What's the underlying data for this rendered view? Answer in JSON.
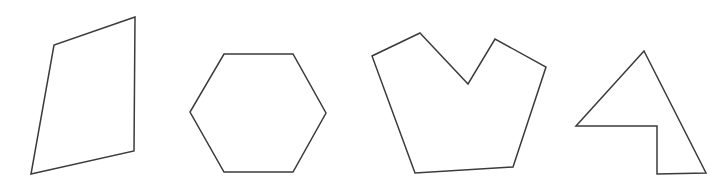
{
  "canvas": {
    "width": 721,
    "height": 185,
    "background_color": "#ffffff",
    "title": "Polygon Shapes"
  },
  "style": {
    "stroke_color": "#3b3b3b",
    "stroke_width": 1.5,
    "fill": "none"
  },
  "shapes": [
    {
      "name": "quadrilateral",
      "label": "Quadrilateral",
      "sides": 4,
      "convex": true,
      "points": "135,17 54,45 31,174 134,151",
      "vertices": [
        [
          135,
          17
        ],
        [
          54,
          45
        ],
        [
          31,
          174
        ],
        [
          134,
          151
        ]
      ]
    },
    {
      "name": "hexagon",
      "label": "Hexagon",
      "sides": 6,
      "convex": true,
      "points": "224,54 293,54 326,113 293,172 224,172 190,112",
      "vertices": [
        [
          224,
          54
        ],
        [
          293,
          54
        ],
        [
          326,
          113
        ],
        [
          293,
          172
        ],
        [
          224,
          172
        ],
        [
          190,
          112
        ]
      ]
    },
    {
      "name": "crown-heptagon",
      "label": "Crown Heptagon",
      "sides": 7,
      "convex": false,
      "points": "420,33 468,84 495,39 546,67 513,167 415,173 372,56",
      "vertices": [
        [
          420,
          33
        ],
        [
          468,
          84
        ],
        [
          495,
          39
        ],
        [
          546,
          67
        ],
        [
          513,
          167
        ],
        [
          415,
          173
        ],
        [
          372,
          56
        ]
      ]
    },
    {
      "name": "arrow-pentagon",
      "label": "Arrow Pentagon",
      "sides": 5,
      "convex": false,
      "points": "644,51 576,126 657,126 657,174 706,173",
      "vertices": [
        [
          644,
          51
        ],
        [
          576,
          126
        ],
        [
          657,
          126
        ],
        [
          657,
          174
        ],
        [
          706,
          173
        ]
      ]
    }
  ]
}
